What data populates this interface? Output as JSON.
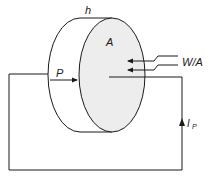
{
  "diagram": {
    "labels": {
      "thickness": "h",
      "area": "A",
      "power_flux": "W/A",
      "polarization": "P",
      "current": "I",
      "current_subscript": "P"
    },
    "colors": {
      "stroke": "#1a1a1a",
      "front_face_fill": "#ededed",
      "background": "#ffffff"
    }
  }
}
